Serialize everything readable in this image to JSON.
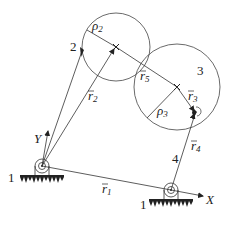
{
  "diagram": {
    "title": "",
    "labels": {
      "link2": "2",
      "link3": "3",
      "link4": "4",
      "ground_left": "1",
      "ground_right": "1",
      "axis_x": "X",
      "axis_y": "Y"
    },
    "vectors": {
      "r1": {
        "base": "r",
        "sub": "1"
      },
      "r2": {
        "base": "r",
        "sub": "2"
      },
      "r3": {
        "base": "r",
        "sub": "3"
      },
      "r4": {
        "base": "r",
        "sub": "4"
      },
      "r5": {
        "base": "r",
        "sub": "5"
      }
    },
    "radii": {
      "rho2": {
        "base": "ρ",
        "sub": "2"
      },
      "rho3": {
        "base": "ρ",
        "sub": "3"
      }
    },
    "colors": {
      "line": "#333333",
      "ground": "#222222",
      "background": "#ffffff"
    }
  }
}
